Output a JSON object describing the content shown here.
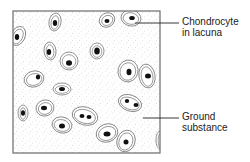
{
  "diagram": {
    "colors": {
      "frame": "#6a6a6a",
      "lacuna_outline": "#777777",
      "nucleus": "#111111",
      "stipple": "#b8b8b8",
      "background": "#ffffff",
      "text": "#222222"
    },
    "frame": {
      "x": 13,
      "y": 11,
      "w": 147,
      "h": 142
    },
    "labels": [
      {
        "id": "chondrocyte",
        "lines": [
          "Chondrocyte",
          "in lacuna"
        ],
        "x": 182,
        "y": 16,
        "leader": {
          "x1": 135,
          "y1": 23,
          "x2": 179,
          "y2": 23
        }
      },
      {
        "id": "ground-substance",
        "lines": [
          "Ground",
          "substance"
        ],
        "x": 182,
        "y": 111,
        "leader": {
          "x1": 143,
          "y1": 118,
          "x2": 179,
          "y2": 118
        }
      }
    ],
    "cells": [
      {
        "cx": 18,
        "cy": 36,
        "rx": 7,
        "ry": 10,
        "rot": 25,
        "nuclei": [
          [
            17,
            37,
            2.2,
            3
          ]
        ]
      },
      {
        "cx": 55,
        "cy": 22,
        "rx": 6,
        "ry": 9,
        "rot": 10,
        "nuclei": [
          [
            55,
            23,
            2.2,
            3
          ]
        ]
      },
      {
        "cx": 107,
        "cy": 20,
        "rx": 8,
        "ry": 7,
        "rot": -30,
        "nuclei": [
          [
            107,
            21,
            2.5,
            2
          ]
        ]
      },
      {
        "cx": 131,
        "cy": 18,
        "rx": 10,
        "ry": 8,
        "rot": 10,
        "nuclei": [
          [
            132,
            18,
            2.8,
            2
          ]
        ]
      },
      {
        "cx": 50,
        "cy": 51,
        "rx": 6,
        "ry": 9,
        "rot": -5,
        "nuclei": [
          [
            49,
            52,
            2.2,
            3
          ]
        ]
      },
      {
        "cx": 97,
        "cy": 51,
        "rx": 7,
        "ry": 8,
        "rot": 0,
        "nuclei": [
          [
            97,
            51,
            2.8,
            3.5
          ]
        ]
      },
      {
        "cx": 69,
        "cy": 61,
        "rx": 9,
        "ry": 9,
        "rot": 0,
        "nuclei": [
          [
            69,
            63,
            3,
            2.8
          ]
        ]
      },
      {
        "cx": 34,
        "cy": 79,
        "rx": 10,
        "ry": 8,
        "rot": -15,
        "nuclei": [
          [
            38,
            77,
            2.2,
            2.5
          ]
        ]
      },
      {
        "cx": 128,
        "cy": 71,
        "rx": 10,
        "ry": 11,
        "rot": 15,
        "nuclei": [
          [
            129,
            72,
            2.5,
            3.2
          ]
        ]
      },
      {
        "cx": 147,
        "cy": 76,
        "rx": 8,
        "ry": 12,
        "rot": -10,
        "nuclei": [
          [
            148,
            76,
            3,
            2.5
          ]
        ]
      },
      {
        "cx": 62,
        "cy": 89,
        "rx": 9,
        "ry": 6,
        "rot": 0,
        "nuclei": [
          [
            62,
            89,
            3,
            2
          ]
        ]
      },
      {
        "cx": 23,
        "cy": 113,
        "rx": 5,
        "ry": 8,
        "rot": 0,
        "nuclei": [
          [
            23,
            113,
            2,
            2.8
          ]
        ]
      },
      {
        "cx": 45,
        "cy": 108,
        "rx": 9,
        "ry": 8,
        "rot": -15,
        "nuclei": [
          [
            44,
            108,
            3,
            2.2
          ]
        ]
      },
      {
        "cx": 130,
        "cy": 103,
        "rx": 12,
        "ry": 8,
        "rot": 20,
        "nuclei": [
          [
            127,
            101,
            2.2,
            2
          ],
          [
            136,
            105,
            2.5,
            2
          ]
        ]
      },
      {
        "cx": 85,
        "cy": 116,
        "rx": 13,
        "ry": 9,
        "rot": 15,
        "nuclei": [
          [
            82,
            116,
            2.5,
            2
          ],
          [
            89,
            117,
            2.5,
            2
          ]
        ]
      },
      {
        "cx": 62,
        "cy": 125,
        "rx": 10,
        "ry": 8,
        "rot": 15,
        "nuclei": [
          [
            62,
            126,
            3,
            2.5
          ]
        ]
      },
      {
        "cx": 107,
        "cy": 133,
        "rx": 11,
        "ry": 9,
        "rot": -20,
        "nuclei": [
          [
            107,
            134,
            3.5,
            2.5
          ]
        ]
      },
      {
        "cx": 126,
        "cy": 141,
        "rx": 9,
        "ry": 11,
        "rot": 20,
        "nuclei": [
          [
            126,
            142,
            2.5,
            2.5
          ]
        ]
      },
      {
        "cx": 160,
        "cy": 140,
        "rx": 4,
        "ry": 9,
        "rot": 0,
        "nuclei": []
      }
    ]
  }
}
